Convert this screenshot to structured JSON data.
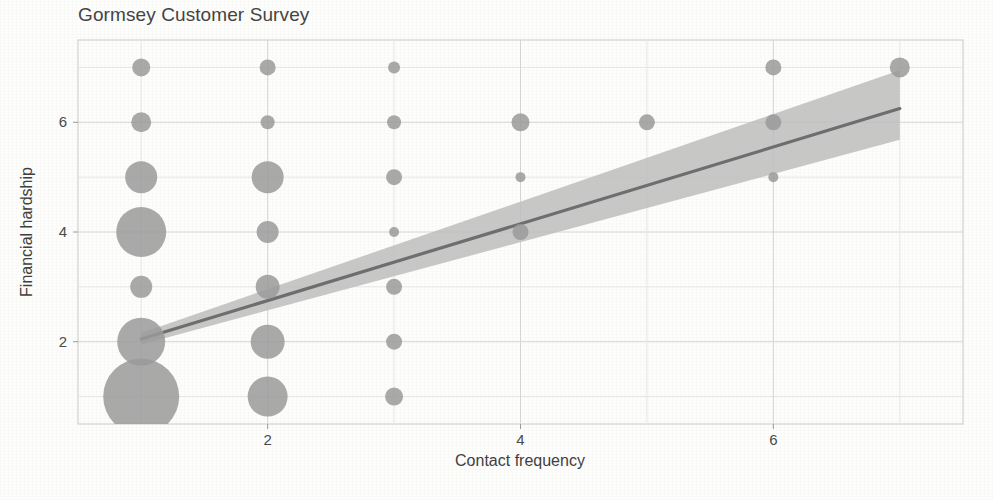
{
  "chart_data": {
    "type": "scatter",
    "title": "Gormsey Customer Survey",
    "xlabel": "Contact frequency",
    "ylabel": "Financial hardship",
    "xlim": [
      0.5,
      7.5
    ],
    "ylim": [
      0.5,
      7.5
    ],
    "xticks": [
      2,
      4,
      6
    ],
    "yticks": [
      2,
      4,
      6
    ],
    "grid": true,
    "legend": "none",
    "marker_style": "bubble-size-encodes-count",
    "series": [
      {
        "name": "Survey respondents",
        "color": "#9a9a9a",
        "points": [
          {
            "x": 1,
            "y": 7,
            "size": 9
          },
          {
            "x": 1,
            "y": 6,
            "size": 10
          },
          {
            "x": 1,
            "y": 5,
            "size": 16
          },
          {
            "x": 1,
            "y": 4,
            "size": 25
          },
          {
            "x": 1,
            "y": 3,
            "size": 11
          },
          {
            "x": 1,
            "y": 2,
            "size": 24
          },
          {
            "x": 1,
            "y": 1,
            "size": 38
          },
          {
            "x": 2,
            "y": 7,
            "size": 8
          },
          {
            "x": 2,
            "y": 6,
            "size": 7
          },
          {
            "x": 2,
            "y": 5,
            "size": 16
          },
          {
            "x": 2,
            "y": 4,
            "size": 11
          },
          {
            "x": 2,
            "y": 3,
            "size": 12
          },
          {
            "x": 2,
            "y": 2,
            "size": 17
          },
          {
            "x": 2,
            "y": 1,
            "size": 20
          },
          {
            "x": 3,
            "y": 7,
            "size": 6
          },
          {
            "x": 3,
            "y": 6,
            "size": 7
          },
          {
            "x": 3,
            "y": 5,
            "size": 8
          },
          {
            "x": 3,
            "y": 4,
            "size": 5
          },
          {
            "x": 3,
            "y": 3,
            "size": 8
          },
          {
            "x": 3,
            "y": 2,
            "size": 8
          },
          {
            "x": 3,
            "y": 1,
            "size": 9
          },
          {
            "x": 4,
            "y": 6,
            "size": 9
          },
          {
            "x": 4,
            "y": 5,
            "size": 5
          },
          {
            "x": 4,
            "y": 4,
            "size": 8
          },
          {
            "x": 5,
            "y": 6,
            "size": 8
          },
          {
            "x": 6,
            "y": 7,
            "size": 8
          },
          {
            "x": 6,
            "y": 6,
            "size": 8
          },
          {
            "x": 6,
            "y": 5,
            "size": 5
          },
          {
            "x": 7,
            "y": 7,
            "size": 10
          }
        ]
      }
    ],
    "regression": {
      "name": "Linear fit with confidence band",
      "line_color": "#6e6e6e",
      "band_color": "#bdbdbd",
      "x_start": 1,
      "x_end": 7,
      "y_start": 2.05,
      "y_end": 6.25,
      "band_lower_start": 1.95,
      "band_upper_start": 2.16,
      "band_lower_end": 5.68,
      "band_upper_end": 6.95
    }
  },
  "axes": {
    "x_tick_labels": [
      "2",
      "4",
      "6"
    ],
    "y_tick_labels": [
      "2",
      "4",
      "6"
    ]
  }
}
